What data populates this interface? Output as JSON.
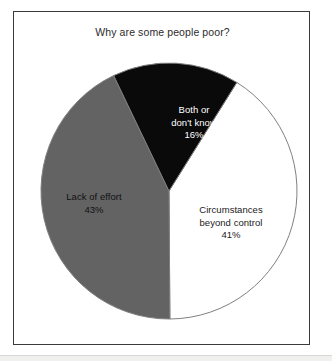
{
  "chart_data": {
    "type": "pie",
    "title": "Why are some people poor?",
    "xlabel": "",
    "ylabel": "",
    "legend_position": "none",
    "grid": false,
    "categories": [
      "Circumstances beyond control",
      "Lack of effort",
      "Both or don't know"
    ],
    "values": [
      41,
      16,
      43
    ],
    "slices": [
      {
        "label": "Circumstances beyond control",
        "label_line1": "Circumstances",
        "label_line2": "beyond control",
        "value": 41,
        "percent_text": "41%",
        "color": "#ffffff",
        "text_color": "#1a1a1a"
      },
      {
        "label": "Lack of effort",
        "label_line1": "Lack of effort",
        "label_line2": "",
        "value": 43,
        "percent_text": "43%",
        "color": "#636363",
        "text_color": "#111111"
      },
      {
        "label": "Both or don't know",
        "label_line1": "Both or",
        "label_line2": "don't know",
        "value": 16,
        "percent_text": "16%",
        "color": "#0a0a0a",
        "text_color": "#ffffff"
      }
    ]
  },
  "chart": {
    "title": "Why are some people poor?",
    "frame_color": "#3b3b3b",
    "background": "#ffffff",
    "outline_color": "#808080"
  },
  "slice_circumstances": {
    "line1": "Circumstances",
    "line2": "beyond control",
    "percent": "41%"
  },
  "slice_lack_of_effort": {
    "line1": "Lack of effort",
    "percent": "43%"
  },
  "slice_both_or_dont_know": {
    "line1": "Both or",
    "line2": "don't know",
    "percent": "16%"
  }
}
